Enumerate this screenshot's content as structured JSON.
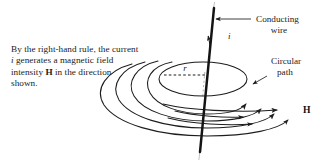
{
  "figure": {
    "background_color": "#ffffff",
    "ink_color": "#1d1d1d"
  },
  "caption": {
    "line1_before_italic": "By the right-hand rule, the",
    "line2_a": "current ",
    "line2_italic": "i",
    "line2_b": " generates a magnetic",
    "line3_a": "field intensity ",
    "line3_bold": "H",
    "line3_b": " in the",
    "line4": "direction shown.",
    "full_text": "By the right-hand rule, the current i generates a magnetic field intensity H in the direction shown."
  },
  "labels": {
    "conducting_wire_line1": "Conducting",
    "conducting_wire_line2": "wire",
    "circular_path_line1": "Circular",
    "circular_path_line2": "path",
    "current_symbol": "i",
    "radius_symbol": "r",
    "field_symbol": "H"
  },
  "diagram": {
    "wire": {
      "name": "conducting-wire",
      "top_x": 213,
      "top_y": 6,
      "bottom_x": 200,
      "bottom_y": 158,
      "current_direction": "upward"
    },
    "circular_path": {
      "name": "circular-path-ellipse",
      "center_x": 202,
      "center_y": 77,
      "rx": 44,
      "ry": 17
    },
    "field_lines_count": 6,
    "arrowheads_count": 7,
    "field_direction": "counterclockwise viewed from above, pointing right at front"
  }
}
